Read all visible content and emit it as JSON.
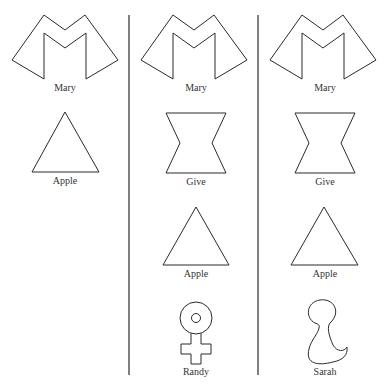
{
  "columns": [
    {
      "items": [
        {
          "symbol": "M-shape",
          "label": "Mary"
        },
        {
          "symbol": "triangle",
          "label": "Apple"
        }
      ]
    },
    {
      "items": [
        {
          "symbol": "M-shape",
          "label": "Mary"
        },
        {
          "symbol": "hourglass",
          "label": "Give"
        },
        {
          "symbol": "triangle",
          "label": "Apple"
        },
        {
          "symbol": "female-sign",
          "label": "Randy"
        }
      ]
    },
    {
      "items": [
        {
          "symbol": "M-shape",
          "label": "Mary"
        },
        {
          "symbol": "hourglass",
          "label": "Give"
        },
        {
          "symbol": "triangle",
          "label": "Apple"
        },
        {
          "symbol": "blob",
          "label": "Sarah"
        }
      ]
    }
  ]
}
